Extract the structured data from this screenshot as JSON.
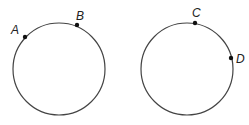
{
  "diagram": {
    "circles": [
      {
        "id": "left",
        "cx": 59,
        "cy": 69,
        "r": 46,
        "points": [
          {
            "label": "A",
            "x": 25,
            "y": 37,
            "lx": 11,
            "ly": 34
          },
          {
            "label": "B",
            "x": 77,
            "y": 25,
            "lx": 77,
            "ly": 20
          }
        ]
      },
      {
        "id": "right",
        "cx": 187,
        "cy": 69,
        "r": 46,
        "points": [
          {
            "label": "C",
            "x": 195,
            "y": 23,
            "lx": 193,
            "ly": 18
          },
          {
            "label": "D",
            "x": 231,
            "y": 58,
            "lx": 236,
            "ly": 63
          }
        ]
      }
    ],
    "stroke_color": "#444444",
    "point_color": "#111111"
  }
}
